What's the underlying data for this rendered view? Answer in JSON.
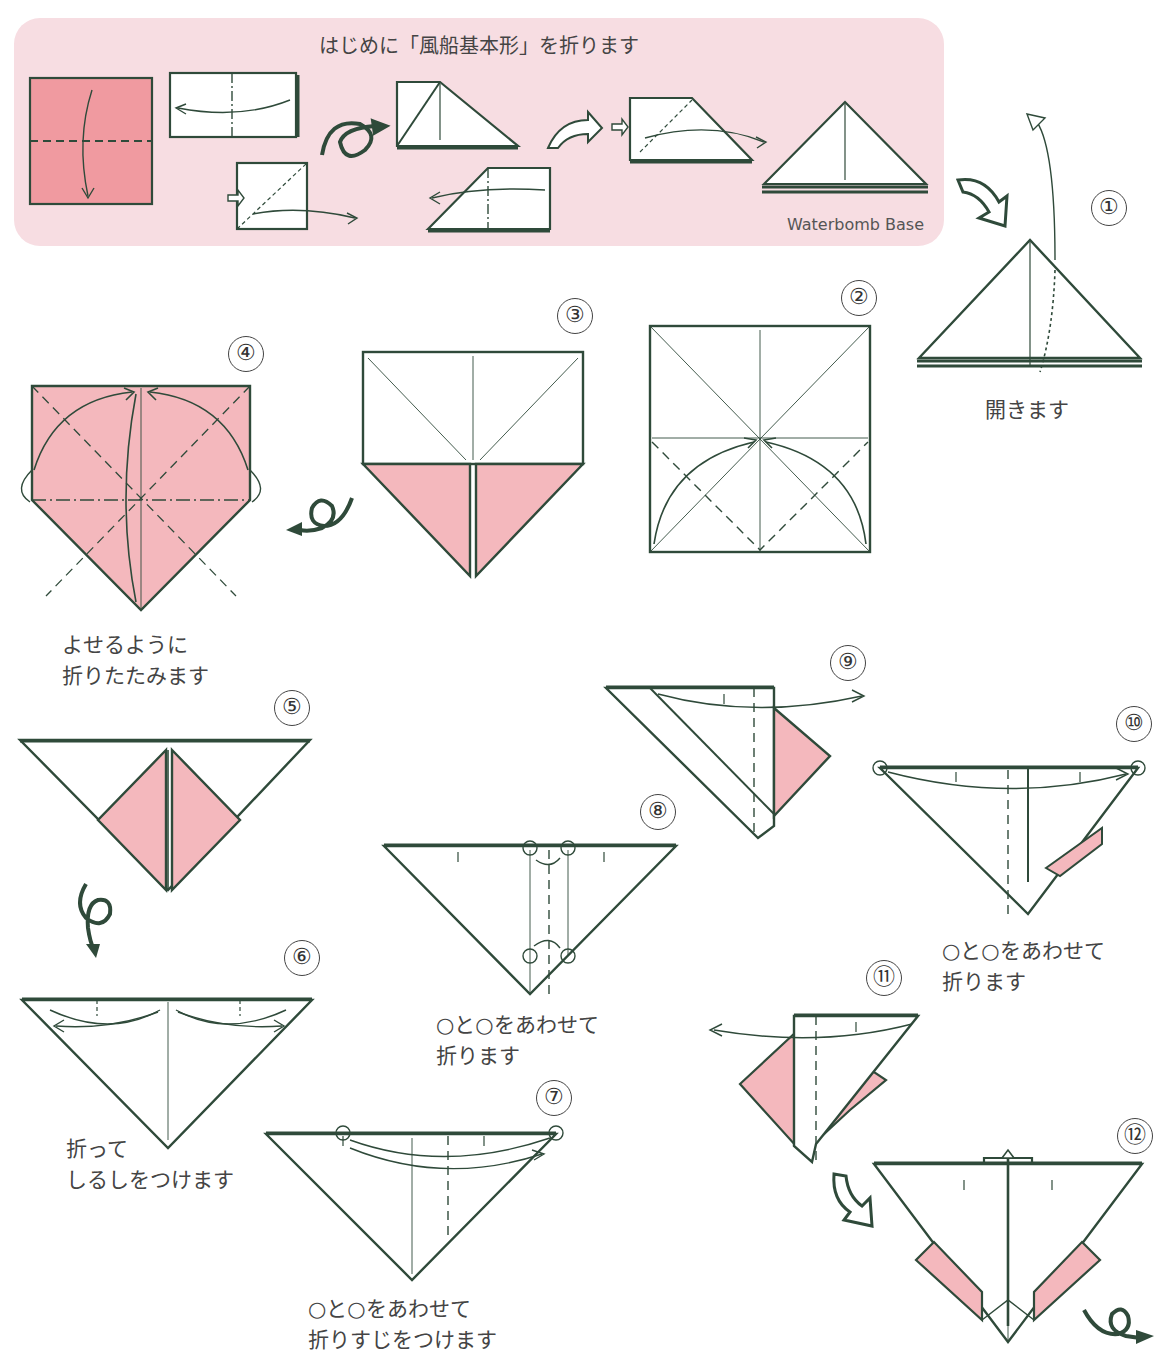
{
  "header": {
    "left_cut_text": "",
    "right_cut_text": ""
  },
  "base_section": {
    "title": "はじめに「風船基本形」を折ります",
    "caption": "Waterbomb Base"
  },
  "colors": {
    "paper_pink": "#f4b8bd",
    "panel_pink": "#f7dde2",
    "line_dark": "#2f4a3a",
    "text": "#444444"
  },
  "steps": [
    {
      "num": "①",
      "note": "開きます"
    },
    {
      "num": "②",
      "note": ""
    },
    {
      "num": "③",
      "note": ""
    },
    {
      "num": "④",
      "note": "よせるように\n折りたたみます"
    },
    {
      "num": "⑤",
      "note": ""
    },
    {
      "num": "⑥",
      "note": "折って\nしるしをつけます"
    },
    {
      "num": "⑦",
      "note": "○と○をあわせて\n折りすじをつけます"
    },
    {
      "num": "⑧",
      "note": "○と○をあわせて\n折ります"
    },
    {
      "num": "⑨",
      "note": ""
    },
    {
      "num": "⑩",
      "note": "○と○をあわせて\n折ります"
    },
    {
      "num": "⑪",
      "note": ""
    },
    {
      "num": "⑫",
      "note": ""
    }
  ],
  "icons": {
    "turn_over": "turn-over-arrow",
    "next": "hollow-next-arrow",
    "fold": "fold-arrow"
  }
}
